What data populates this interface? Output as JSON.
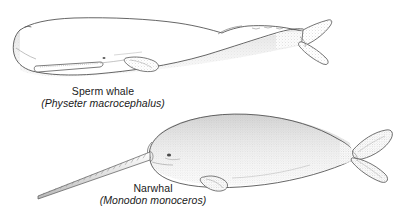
{
  "figure": {
    "kind": "scientific-line-drawing",
    "background_color": "#ffffff",
    "ink_color": "#3a3a3a",
    "shading_color": "#9a9a9a",
    "width": 419,
    "height": 214,
    "subject_count": 2
  },
  "specimens": [
    {
      "id": "sperm-whale",
      "common_name": "Sperm whale",
      "scientific_name": "(Physeter macrocephalus)",
      "orientation": "head-left",
      "features": [
        "blunt squared head",
        "blowhole",
        "narrow lower jaw with teeth",
        "pectoral flipper",
        "dorsal hump",
        "knuckled caudal ridge",
        "triangular tail flukes"
      ]
    },
    {
      "id": "narwhal",
      "common_name": "Narwhal",
      "scientific_name": "(Monodon monoceros)",
      "orientation": "head-left",
      "features": [
        "rounded melon head",
        "spiral tusk",
        "eye",
        "no dorsal fin",
        "pectoral flipper",
        "fan-shaped tail flukes"
      ]
    }
  ]
}
